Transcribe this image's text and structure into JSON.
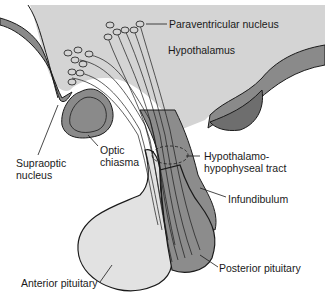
{
  "diagram": {
    "colors": {
      "hypothalamus": "#d4d4d4",
      "wall_dark": "#8a8a8a",
      "posterior_pituitary": "#8c8c8c",
      "anterior_pituitary": "#e2e2e2",
      "outline": "#1a1a1a"
    },
    "labels": {
      "paraventricular": "Paraventricular nucleus",
      "hypothalamus": "Hypothalamus",
      "supraoptic_line1": "Supraoptic",
      "supraoptic_line2": "nucleus",
      "optic_line1": "Optic",
      "optic_line2": "chiasma",
      "tract_line1": "Hypothalamo-",
      "tract_line2": "hypophyseal tract",
      "infundibulum": "Infundibulum",
      "anterior": "Anterior pituitary",
      "posterior": "Posterior pituitary"
    }
  }
}
